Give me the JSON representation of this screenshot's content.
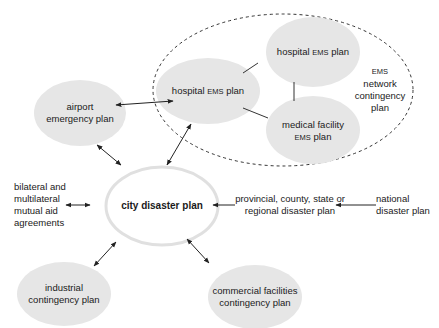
{
  "diagram": {
    "nodes": {
      "city": {
        "label": "city disaster plan"
      },
      "airport": {
        "line1": "airport",
        "line2": "emergency plan"
      },
      "hospital_main": {
        "pre": "hospital ",
        "ems": "EMS",
        "post": " plan"
      },
      "hospital_network": {
        "pre": "hospital ",
        "ems": "EMS",
        "post": " plan"
      },
      "medical": {
        "line1": "medical facility",
        "ems": "EMS",
        "post": " plan"
      },
      "ems_network": {
        "ems": "EMS",
        "line2": "network",
        "line3": "contingency",
        "line4": "plan"
      },
      "bilateral": {
        "line1": "bilateral and",
        "line2": "multilateral",
        "line3": "mutual aid",
        "line4": "agreements"
      },
      "provincial": {
        "line1": "provincial, county, state or",
        "line2": "regional disaster plan"
      },
      "national": {
        "line1": "national",
        "line2": "disaster plan"
      },
      "industrial": {
        "line1": "industrial",
        "line2": "contingency plan"
      },
      "commercial": {
        "line1": "commercial facilities",
        "line2": "contingency plan"
      }
    },
    "colors": {
      "bubble_fill": "#e6e6e6",
      "line": "#222222",
      "city_outline": "#e0e0e0"
    }
  }
}
